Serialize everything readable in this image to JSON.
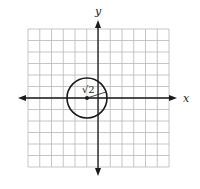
{
  "diagram": {
    "type": "coordinate-plane",
    "grid": {
      "cells_x": 12,
      "cells_y": 12,
      "x_range": [
        -6,
        6
      ],
      "y_range": [
        -6,
        6
      ]
    },
    "axes": {
      "x_label": "x",
      "y_label": "y"
    },
    "circle": {
      "center": [
        -1,
        0
      ],
      "radius_label": "√2",
      "radius": 1.414
    },
    "colors": {
      "grid": "#b8b8b8",
      "axis": "#1a1a1a",
      "circle": "#1a1a1a"
    }
  }
}
